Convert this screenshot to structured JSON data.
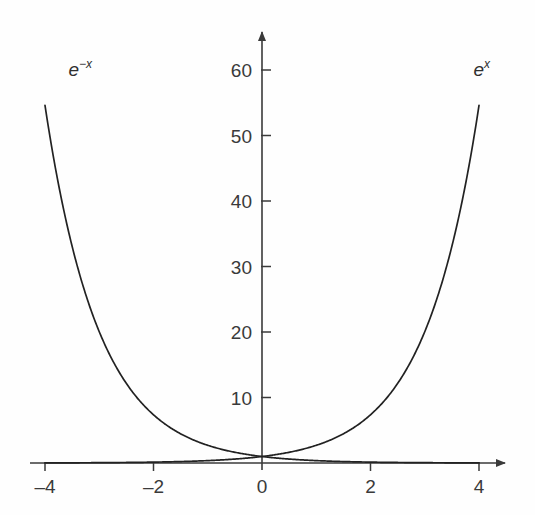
{
  "figure": {
    "background_color": "#fefefe",
    "ink_color": "#3a3a3a",
    "curve_color": "#222222"
  },
  "chart_data": {
    "type": "line",
    "title": "",
    "subtitle": "",
    "xlabel": "",
    "ylabel": "",
    "xlim": [
      -4.6,
      4.6
    ],
    "ylim": [
      -1.5,
      66
    ],
    "grid": false,
    "legend_position": "inline-curve-labels",
    "axis_style": "arrow-tipped cartesian axes crossing at origin",
    "x_ticks": [
      -4,
      -2,
      0,
      2,
      4
    ],
    "x_tick_labels": [
      "–4",
      "–2",
      "0",
      "2",
      "4"
    ],
    "y_ticks": [
      10,
      20,
      30,
      40,
      50,
      60
    ],
    "y_tick_labels": [
      "10",
      "20",
      "30",
      "40",
      "50",
      "60"
    ],
    "series": [
      {
        "name": "e^x",
        "label_html": "e<sup>x</sup>",
        "label_text": "e^x",
        "label_x": 4.05,
        "label_y": 60.2,
        "x": [
          -4,
          -3.5,
          -3,
          -2.5,
          -2,
          -1.5,
          -1,
          -0.5,
          0,
          0.5,
          1,
          1.5,
          2,
          2.5,
          3,
          3.5,
          4
        ],
        "y": [
          0.018,
          0.03,
          0.05,
          0.082,
          0.135,
          0.223,
          0.368,
          0.607,
          1,
          1.649,
          2.718,
          4.482,
          7.389,
          12.182,
          20.086,
          33.115,
          54.598
        ]
      },
      {
        "name": "e^-x",
        "label_html": "e<sup>−x</sup>",
        "label_text": "e^-x",
        "label_x": -3.35,
        "label_y": 60.2,
        "x": [
          -4,
          -3.5,
          -3,
          -2.5,
          -2,
          -1.5,
          -1,
          -0.5,
          0,
          0.5,
          1,
          1.5,
          2,
          2.5,
          3,
          3.5,
          4
        ],
        "y": [
          54.598,
          33.115,
          20.086,
          12.182,
          7.389,
          4.482,
          2.718,
          1.649,
          1,
          0.607,
          0.368,
          0.223,
          0.135,
          0.082,
          0.05,
          0.03,
          0.018
        ]
      }
    ],
    "annotations": [
      {
        "text": "e^x curve label",
        "at": [
          4.05,
          60.2
        ]
      },
      {
        "text": "e^-x curve label",
        "at": [
          -3.35,
          60.2
        ]
      }
    ]
  }
}
